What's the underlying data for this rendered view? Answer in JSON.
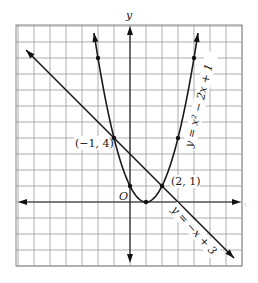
{
  "chart_data": {
    "type": "line",
    "title": "",
    "xlabel": "x",
    "ylabel": "y",
    "xlim": [
      -7,
      7
    ],
    "ylim": [
      -4,
      11
    ],
    "grid": true,
    "grid_step": 1,
    "origin_label": "O",
    "series": [
      {
        "name": "y = x² − 2x + 1",
        "kind": "parabola",
        "equation": "y = x^2 - 2x + 1",
        "x_range": [
          -2.25,
          4.25
        ],
        "marked_points": [
          [
            -2,
            9
          ],
          [
            -1,
            4
          ],
          [
            0,
            1
          ],
          [
            1,
            0
          ],
          [
            2,
            1
          ],
          [
            3,
            4
          ],
          [
            4,
            9
          ]
        ],
        "label": "y = x² − 2x + 1"
      },
      {
        "name": "y = −x + 3",
        "kind": "line",
        "equation": "y = -x + 3",
        "x_range": [
          -6.5,
          6.5
        ],
        "label": "y = −x + 3"
      }
    ],
    "annotations": [
      {
        "text": "(−1, 4)",
        "point": [
          -1,
          4
        ]
      },
      {
        "text": "(2, 1)",
        "point": [
          2,
          1
        ]
      }
    ]
  },
  "labels": {
    "y_axis": "y",
    "x_axis": ":",
    "origin": "O",
    "point_a": "(−1, 4)",
    "point_b": "(2, 1)",
    "parabola": "y = x² − 2x + 1",
    "line": "y = −x + 3"
  }
}
